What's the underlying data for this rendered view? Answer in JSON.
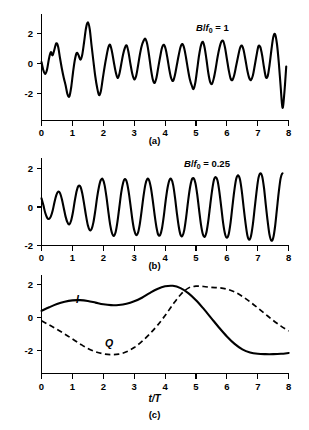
{
  "figure": {
    "panels": [
      {
        "id": "a",
        "caption": "(a)",
        "annotation_prefix": "B",
        "annotation_slash": "/",
        "annotation_symbol": "f",
        "annotation_subscript": "0",
        "annotation_value": " = 1",
        "annotation_text": "B/f0 = 1"
      },
      {
        "id": "b",
        "caption": "(b)",
        "annotation_prefix": "B",
        "annotation_slash": "/",
        "annotation_symbol": "f",
        "annotation_subscript": "0",
        "annotation_value": " = 0.25",
        "annotation_text": "B/f0 = 0.25"
      },
      {
        "id": "c",
        "caption": "(c)",
        "xlabel": "t/T",
        "curve_labels": {
          "inphase": "I",
          "quadrature": "Q"
        }
      }
    ],
    "xticklabels": [
      "0",
      "1",
      "2",
      "3",
      "4",
      "5",
      "6",
      "7",
      "8"
    ],
    "yticklabels": [
      "-2",
      "0",
      "2"
    ],
    "colors": {
      "ink": "#000000",
      "background": "#ffffff"
    }
  },
  "chart_data": [
    {
      "type": "line",
      "panel": "a",
      "title": "B/f0 = 1",
      "xlabel": "",
      "ylabel": "",
      "xlim": [
        0,
        8
      ],
      "ylim": [
        -3,
        3
      ],
      "xticks": [
        0,
        1,
        2,
        3,
        4,
        5,
        6,
        7,
        8
      ],
      "yticks": [
        -2,
        0,
        2
      ],
      "grid": false,
      "legend": "none",
      "series": [
        {
          "name": "wideband noise waveform",
          "linestyle": "solid",
          "x": [
            0.0,
            0.06,
            0.12,
            0.18,
            0.24,
            0.3,
            0.36,
            0.42,
            0.48,
            0.54,
            0.6,
            0.66,
            0.72,
            0.78,
            0.84,
            0.9,
            0.96,
            1.02,
            1.08,
            1.14,
            1.2,
            1.26,
            1.32,
            1.38,
            1.44,
            1.5,
            1.56,
            1.62,
            1.68,
            1.74,
            1.8,
            1.86,
            1.92,
            1.98,
            2.04,
            2.1,
            2.16,
            2.22,
            2.28,
            2.34,
            2.4,
            2.46,
            2.52,
            2.58,
            2.64,
            2.7,
            2.76,
            2.82,
            2.88,
            2.94,
            3.0,
            3.06,
            3.12,
            3.18,
            3.24,
            3.3,
            3.36,
            3.42,
            3.48,
            3.54,
            3.6,
            3.66,
            3.72,
            3.78,
            3.84,
            3.9,
            3.96,
            4.02,
            4.08,
            4.14,
            4.2,
            4.26,
            4.32,
            4.38,
            4.44,
            4.5,
            4.56,
            4.62,
            4.68,
            4.74,
            4.8,
            4.86,
            4.92,
            4.98,
            5.04,
            5.1,
            5.16,
            5.22,
            5.28,
            5.34,
            5.4,
            5.46,
            5.52,
            5.58,
            5.64,
            5.7,
            5.76,
            5.82,
            5.88,
            5.94,
            6.0,
            6.06,
            6.12,
            6.18,
            6.24,
            6.3,
            6.36,
            6.42,
            6.48,
            6.54,
            6.6,
            6.66,
            6.72,
            6.78,
            6.84,
            6.9,
            6.96,
            7.02,
            7.08,
            7.14,
            7.2,
            7.26,
            7.32,
            7.38,
            7.44,
            7.5,
            7.56,
            7.62,
            7.68,
            7.74,
            7.8,
            7.86,
            7.92
          ],
          "y": [
            0.1,
            -0.45,
            -0.7,
            -0.4,
            0.3,
            0.75,
            0.55,
            0.95,
            1.35,
            1.1,
            0.35,
            -0.35,
            -0.95,
            -1.45,
            -2.05,
            -2.2,
            -1.6,
            -0.6,
            0.25,
            0.7,
            0.55,
            0.25,
            0.6,
            1.45,
            2.35,
            2.75,
            2.3,
            1.2,
            0.15,
            -0.85,
            -1.6,
            -2.1,
            -1.85,
            -1.05,
            -0.25,
            0.45,
            1.05,
            1.25,
            0.8,
            0.1,
            -0.55,
            -0.95,
            -0.7,
            -0.05,
            0.6,
            1.05,
            1.2,
            0.7,
            -0.05,
            -0.7,
            -1.05,
            -0.85,
            -0.2,
            0.55,
            1.15,
            1.5,
            1.65,
            1.3,
            0.55,
            -0.35,
            -1.05,
            -1.3,
            -0.95,
            -0.25,
            0.45,
            1.05,
            1.25,
            0.95,
            0.3,
            -0.45,
            -1.0,
            -1.15,
            -0.75,
            -0.1,
            0.55,
            1.1,
            1.3,
            1.0,
            0.35,
            -0.4,
            -1.05,
            -1.45,
            -1.7,
            -1.25,
            -0.35,
            0.55,
            1.2,
            1.45,
            1.05,
            0.25,
            -0.65,
            -1.25,
            -1.35,
            -0.95,
            -0.3,
            0.45,
            1.05,
            1.45,
            1.5,
            1.05,
            0.3,
            -0.45,
            -1.0,
            -1.1,
            -0.75,
            -0.15,
            0.45,
            1.0,
            1.2,
            0.9,
            0.25,
            -0.45,
            -0.95,
            -1.1,
            -0.8,
            -0.15,
            0.55,
            1.15,
            1.1,
            0.55,
            -0.25,
            -0.9,
            -0.85,
            -0.1,
            0.9,
            1.75,
            1.95,
            1.3,
            0.05,
            -1.55,
            -2.95,
            -1.95,
            -0.2,
            0.95,
            1.45,
            0.65
          ]
        }
      ]
    },
    {
      "type": "line",
      "panel": "b",
      "title": "B/f0 = 0.25",
      "xlabel": "",
      "ylabel": "",
      "xlim": [
        0,
        8
      ],
      "ylim": [
        -2.2,
        2.6
      ],
      "xticks": [
        0,
        1,
        2,
        3,
        4,
        5,
        6,
        7,
        8
      ],
      "yticks": [
        -2,
        0,
        2
      ],
      "grid": false,
      "legend": "none",
      "series": [
        {
          "name": "narrowband noise waveform",
          "linestyle": "solid",
          "x": [
            0.0,
            0.06,
            0.12,
            0.18,
            0.24,
            0.3,
            0.36,
            0.42,
            0.48,
            0.54,
            0.6,
            0.66,
            0.72,
            0.78,
            0.84,
            0.9,
            0.96,
            1.02,
            1.08,
            1.14,
            1.2,
            1.26,
            1.32,
            1.38,
            1.44,
            1.5,
            1.56,
            1.62,
            1.68,
            1.74,
            1.8,
            1.86,
            1.92,
            1.98,
            2.04,
            2.1,
            2.16,
            2.22,
            2.28,
            2.34,
            2.4,
            2.46,
            2.52,
            2.58,
            2.64,
            2.7,
            2.76,
            2.82,
            2.88,
            2.94,
            3.0,
            3.06,
            3.12,
            3.18,
            3.24,
            3.3,
            3.36,
            3.42,
            3.48,
            3.54,
            3.6,
            3.66,
            3.72,
            3.78,
            3.84,
            3.9,
            3.96,
            4.02,
            4.08,
            4.14,
            4.2,
            4.26,
            4.32,
            4.38,
            4.44,
            4.5,
            4.56,
            4.62,
            4.68,
            4.74,
            4.8,
            4.86,
            4.92,
            4.98,
            5.04,
            5.1,
            5.16,
            5.22,
            5.28,
            5.34,
            5.4,
            5.46,
            5.52,
            5.58,
            5.64,
            5.7,
            5.76,
            5.82,
            5.88,
            5.94,
            6.0,
            6.06,
            6.12,
            6.18,
            6.24,
            6.3,
            6.36,
            6.42,
            6.48,
            6.54,
            6.6,
            6.66,
            6.72,
            6.78,
            6.84,
            6.9,
            6.96,
            7.02,
            7.08,
            7.14,
            7.2,
            7.26,
            7.32,
            7.38,
            7.44,
            7.5,
            7.56,
            7.62,
            7.68,
            7.74,
            7.8,
            7.86,
            7.92
          ],
          "y": [
            0.45,
            0.1,
            -0.3,
            -0.55,
            -0.62,
            -0.5,
            -0.2,
            0.25,
            0.62,
            0.8,
            0.72,
            0.4,
            -0.05,
            -0.5,
            -0.8,
            -0.9,
            -0.7,
            -0.25,
            0.35,
            0.85,
            1.1,
            1.05,
            0.7,
            0.15,
            -0.45,
            -0.95,
            -1.2,
            -1.15,
            -0.8,
            -0.2,
            0.5,
            1.05,
            1.4,
            1.45,
            1.15,
            0.55,
            -0.2,
            -0.9,
            -1.35,
            -1.5,
            -1.3,
            -0.75,
            0.0,
            0.75,
            1.25,
            1.45,
            1.3,
            0.8,
            0.1,
            -0.65,
            -1.2,
            -1.45,
            -1.35,
            -0.9,
            -0.2,
            0.55,
            1.15,
            1.45,
            1.4,
            1.0,
            0.35,
            -0.4,
            -1.05,
            -1.45,
            -1.45,
            -1.1,
            -0.45,
            0.35,
            1.0,
            1.4,
            1.45,
            1.15,
            0.5,
            -0.3,
            -1.0,
            -1.45,
            -1.5,
            -1.2,
            -0.55,
            0.25,
            0.95,
            1.4,
            1.5,
            1.25,
            0.65,
            -0.15,
            -0.9,
            -1.4,
            -1.55,
            -1.3,
            -0.7,
            0.1,
            0.85,
            1.4,
            1.55,
            1.35,
            0.75,
            -0.05,
            -0.85,
            -1.4,
            -1.6,
            -1.4,
            -0.8,
            0.05,
            0.85,
            1.45,
            1.65,
            1.45,
            0.85,
            0.0,
            -0.8,
            -1.45,
            -1.7,
            -1.5,
            -0.9,
            -0.05,
            0.8,
            1.5,
            1.75,
            1.6,
            1.0,
            0.1,
            -0.75,
            -1.45,
            -1.75,
            -1.6,
            -1.0,
            -0.1,
            0.8,
            1.5,
            1.75,
            1.6
          ]
        }
      ]
    },
    {
      "type": "line",
      "panel": "c",
      "title": "",
      "xlabel": "t/T",
      "ylabel": "",
      "xlim": [
        0,
        8
      ],
      "ylim": [
        -2.8,
        2.6
      ],
      "xticks": [
        0,
        1,
        2,
        3,
        4,
        5,
        6,
        7,
        8
      ],
      "yticks": [
        -2,
        0,
        2
      ],
      "grid": false,
      "legend": "inline labels I and Q",
      "series": [
        {
          "name": "I",
          "linestyle": "solid",
          "x": [
            0.0,
            0.25,
            0.5,
            0.75,
            1.0,
            1.25,
            1.5,
            1.75,
            2.0,
            2.25,
            2.5,
            2.75,
            3.0,
            3.25,
            3.5,
            3.75,
            4.0,
            4.25,
            4.5,
            4.75,
            5.0,
            5.25,
            5.5,
            5.75,
            6.0,
            6.25,
            6.5,
            6.75,
            7.0,
            7.25,
            7.5,
            7.75,
            8.0
          ],
          "y": [
            0.4,
            0.62,
            0.82,
            0.96,
            1.04,
            1.05,
            1.0,
            0.9,
            0.8,
            0.75,
            0.76,
            0.83,
            0.98,
            1.2,
            1.48,
            1.73,
            1.89,
            1.92,
            1.78,
            1.48,
            1.05,
            0.52,
            -0.05,
            -0.62,
            -1.15,
            -1.6,
            -1.93,
            -2.12,
            -2.2,
            -2.22,
            -2.22,
            -2.2,
            -2.15
          ]
        },
        {
          "name": "Q",
          "linestyle": "dashed",
          "x": [
            0.0,
            0.25,
            0.5,
            0.75,
            1.0,
            1.25,
            1.5,
            1.75,
            2.0,
            2.25,
            2.5,
            2.75,
            3.0,
            3.25,
            3.5,
            3.75,
            4.0,
            4.25,
            4.5,
            4.75,
            5.0,
            5.25,
            5.5,
            5.75,
            6.0,
            6.25,
            6.5,
            6.75,
            7.0,
            7.25,
            7.5,
            7.75,
            8.0
          ],
          "y": [
            -0.2,
            -0.45,
            -0.72,
            -1.0,
            -1.3,
            -1.6,
            -1.88,
            -2.08,
            -2.2,
            -2.25,
            -2.22,
            -2.08,
            -1.82,
            -1.45,
            -1.0,
            -0.48,
            0.12,
            0.78,
            1.38,
            1.78,
            1.9,
            1.88,
            1.82,
            1.8,
            1.72,
            1.55,
            1.28,
            0.95,
            0.58,
            0.2,
            -0.18,
            -0.52,
            -0.82
          ]
        }
      ]
    }
  ]
}
